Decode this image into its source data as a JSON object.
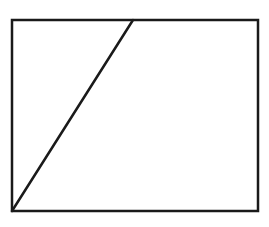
{
  "diagram": {
    "canvas": {
      "width": 269,
      "height": 227,
      "background": "#ffffff"
    },
    "stroke_color": "#1a1a1a",
    "rectangle": {
      "x1": 12,
      "y1": 20,
      "x2": 258,
      "y2": 211,
      "stroke_width": 2.5
    },
    "diagonal": {
      "from": {
        "x": 12,
        "y": 211
      },
      "to": {
        "x": 133,
        "y": 20
      },
      "stroke_width": 2.5
    },
    "labels": []
  }
}
